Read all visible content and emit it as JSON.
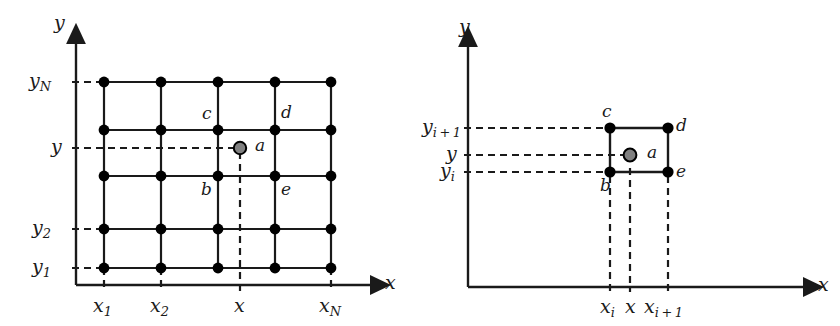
{
  "figure": {
    "type": "diagram"
  },
  "style": {
    "line_color": "#1a1a1a",
    "node_fill": "#000000",
    "point_a_fill": "#808080",
    "point_a_stroke": "#000000",
    "background": "#ffffff",
    "dash_pattern": "7,5"
  },
  "panels": [
    {
      "id": "left",
      "name": "full-grid-panel",
      "axes": {
        "x_label": "x",
        "y_label": "y"
      },
      "x_ticks": [
        {
          "label_main": "x",
          "label_sub": "1"
        },
        {
          "label_main": "x",
          "label_sub": "2"
        },
        {
          "label_main": "x",
          "label_sub": ""
        },
        {
          "label_main": "x",
          "label_sub": "N"
        }
      ],
      "y_ticks": [
        {
          "label_main": "y",
          "label_sub": "N"
        },
        {
          "label_main": "y",
          "label_sub": ""
        },
        {
          "label_main": "y",
          "label_sub": "2"
        },
        {
          "label_main": "y",
          "label_sub": "1"
        }
      ],
      "grid": {
        "columns": 5,
        "rows": 5
      },
      "node_labels": [
        {
          "key": "c",
          "text": "c"
        },
        {
          "key": "d",
          "text": "d"
        },
        {
          "key": "a",
          "text": "a"
        },
        {
          "key": "b",
          "text": "b"
        },
        {
          "key": "e",
          "text": "e"
        }
      ]
    },
    {
      "id": "right",
      "name": "single-cell-panel",
      "axes": {
        "x_label": "x",
        "y_label": "y"
      },
      "x_ticks": [
        {
          "label_main": "x",
          "label_sub": "i"
        },
        {
          "label_main": "x",
          "label_sub": ""
        },
        {
          "label_main": "x",
          "label_sub": "i + 1"
        }
      ],
      "y_ticks": [
        {
          "label_main": "y",
          "label_sub": "i + 1"
        },
        {
          "label_main": "y",
          "label_sub": ""
        },
        {
          "label_main": "y",
          "label_sub": "i"
        }
      ],
      "node_labels": [
        {
          "key": "c",
          "text": "c"
        },
        {
          "key": "d",
          "text": "d"
        },
        {
          "key": "a",
          "text": "a"
        },
        {
          "key": "b",
          "text": "b"
        },
        {
          "key": "e",
          "text": "e"
        }
      ]
    }
  ]
}
